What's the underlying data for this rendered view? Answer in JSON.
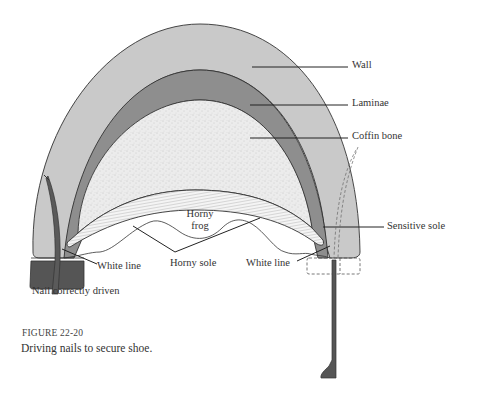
{
  "figure": {
    "number_prefix": "FIGURE",
    "number": "22-20",
    "caption": "Driving nails to secure shoe."
  },
  "labels": {
    "wall": "Wall",
    "laminae": "Laminae",
    "coffin_bone": "Coffin bone",
    "sensitive_sole": "Sensitive sole",
    "horny_frog_line1": "Horny",
    "horny_frog_line2": "frog",
    "horny_sole": "Horny sole",
    "white_line_left": "White line",
    "white_line_right": "White line",
    "nail_correctly_driven": "Nail correctly driven"
  },
  "colors": {
    "wall": "#c9c9c9",
    "laminae": "#8e8e8e",
    "coffin_bone": "#ebebeb",
    "sensitive_sole": "#f2f2f2",
    "shoe": "#555555",
    "nail": "#555555",
    "outline": "#333333"
  }
}
